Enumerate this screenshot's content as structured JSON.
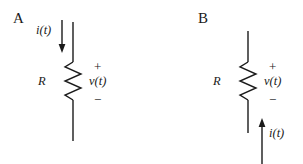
{
  "figure": {
    "background_color": "#ffffff",
    "ink_color": "#1a1a1a",
    "width": 303,
    "height": 164
  },
  "panels": [
    {
      "id": "A",
      "label": "A",
      "resistor_label": "R",
      "voltage_label": "v(t)",
      "plus_sign": "+",
      "minus_sign": "−",
      "current_label": "i(t)",
      "current_direction": "down",
      "current_arrow_position": "top",
      "polarity_plus_position": "top",
      "polarity_minus_position": "bottom"
    },
    {
      "id": "B",
      "label": "B",
      "resistor_label": "R",
      "voltage_label": "v(t)",
      "plus_sign": "+",
      "minus_sign": "−",
      "current_label": "i(t)",
      "current_direction": "up",
      "current_arrow_position": "bottom",
      "polarity_plus_position": "top",
      "polarity_minus_position": "bottom"
    }
  ]
}
